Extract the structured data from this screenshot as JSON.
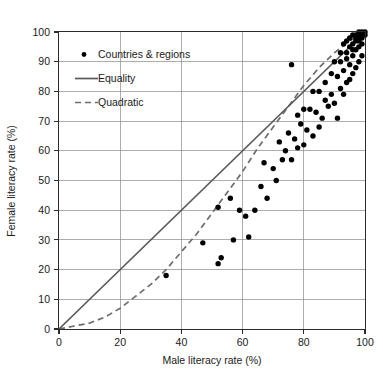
{
  "figure": {
    "caption_top": "",
    "caption_bottom": ""
  },
  "chart_data": {
    "type": "scatter",
    "title": "",
    "xlabel": "Male literacy rate (%)",
    "ylabel": "Female literacy rate (%)",
    "xlim": [
      0,
      100
    ],
    "ylim": [
      0,
      100
    ],
    "xticks": [
      0,
      20,
      40,
      60,
      80,
      100
    ],
    "yticks": [
      0,
      10,
      20,
      30,
      40,
      50,
      60,
      70,
      80,
      90,
      100
    ],
    "xtick_labels": [
      "0",
      "20",
      "40",
      "60",
      "80",
      "100"
    ],
    "ytick_labels": [
      "0",
      "10",
      "20",
      "30",
      "40",
      "50",
      "60",
      "70",
      "80",
      "90",
      "100"
    ],
    "grid": true,
    "grid_x_every": 20,
    "grid_y_every": 10,
    "legend_position": "upper-left-inside",
    "legend": [
      {
        "label": "Countries & regions",
        "marker": "dot",
        "color": "#000000"
      },
      {
        "label": "Equality",
        "marker": "solid-line",
        "color": "#595959"
      },
      {
        "label": "Quadratic",
        "marker": "dashed-line",
        "color": "#6d6d6d"
      }
    ],
    "series": [
      {
        "name": "Countries & regions",
        "type": "scatter",
        "marker": "dot",
        "color": "#000000",
        "points": [
          [
            35,
            18
          ],
          [
            52,
            22
          ],
          [
            53,
            24
          ],
          [
            47,
            29
          ],
          [
            57,
            30
          ],
          [
            62,
            31
          ],
          [
            61,
            38
          ],
          [
            59,
            40
          ],
          [
            64,
            40
          ],
          [
            52,
            41
          ],
          [
            56,
            44
          ],
          [
            68,
            44
          ],
          [
            66,
            48
          ],
          [
            71,
            50
          ],
          [
            70,
            54
          ],
          [
            67,
            56
          ],
          [
            73,
            57
          ],
          [
            76,
            57
          ],
          [
            74,
            60
          ],
          [
            78,
            61
          ],
          [
            80,
            62
          ],
          [
            72,
            63
          ],
          [
            77,
            64
          ],
          [
            83,
            65
          ],
          [
            81,
            67
          ],
          [
            85,
            68
          ],
          [
            79,
            69
          ],
          [
            86,
            71
          ],
          [
            91,
            71
          ],
          [
            84,
            73
          ],
          [
            82,
            74
          ],
          [
            88,
            75
          ],
          [
            90,
            76
          ],
          [
            87,
            77
          ],
          [
            89,
            79
          ],
          [
            93,
            79
          ],
          [
            83,
            80
          ],
          [
            92,
            81
          ],
          [
            76,
            89
          ],
          [
            94,
            83
          ],
          [
            95,
            84
          ],
          [
            91,
            85
          ],
          [
            96,
            86
          ],
          [
            93,
            87
          ],
          [
            97,
            88
          ],
          [
            95,
            89
          ],
          [
            90,
            90
          ],
          [
            98,
            90
          ],
          [
            94,
            91
          ],
          [
            96,
            92
          ],
          [
            99,
            92
          ],
          [
            92,
            93
          ],
          [
            97,
            94
          ],
          [
            95,
            95
          ],
          [
            98,
            95
          ],
          [
            99,
            96
          ],
          [
            96,
            96
          ],
          [
            97,
            97
          ],
          [
            98,
            97
          ],
          [
            99,
            98
          ],
          [
            97,
            98
          ],
          [
            98,
            98
          ],
          [
            99,
            99
          ],
          [
            98,
            99
          ],
          [
            99,
            99
          ],
          [
            100,
            99
          ],
          [
            99,
            100
          ],
          [
            100,
            100
          ],
          [
            98,
            100
          ],
          [
            96,
            99
          ],
          [
            97,
            99
          ],
          [
            95,
            98
          ],
          [
            94,
            97
          ],
          [
            93,
            96
          ],
          [
            96,
            94
          ],
          [
            94,
            93
          ],
          [
            92,
            90
          ],
          [
            89,
            86
          ],
          [
            87,
            83
          ],
          [
            85,
            80
          ],
          [
            80,
            74
          ],
          [
            78,
            72
          ],
          [
            75,
            66
          ]
        ]
      },
      {
        "name": "Equality",
        "type": "line",
        "style": "solid",
        "color": "#595959",
        "points": [
          [
            0,
            0
          ],
          [
            100,
            100
          ]
        ]
      },
      {
        "name": "Quadratic",
        "type": "line",
        "style": "dashed",
        "color": "#6d6d6d",
        "points": [
          [
            0,
            0
          ],
          [
            5,
            1
          ],
          [
            10,
            2
          ],
          [
            15,
            4
          ],
          [
            20,
            7
          ],
          [
            25,
            11
          ],
          [
            30,
            15
          ],
          [
            35,
            20
          ],
          [
            40,
            26
          ],
          [
            45,
            32
          ],
          [
            50,
            39
          ],
          [
            55,
            46
          ],
          [
            60,
            53
          ],
          [
            65,
            61
          ],
          [
            70,
            68
          ],
          [
            75,
            75
          ],
          [
            80,
            82
          ],
          [
            85,
            88
          ],
          [
            90,
            93
          ],
          [
            95,
            97
          ],
          [
            100,
            100
          ]
        ]
      }
    ]
  }
}
